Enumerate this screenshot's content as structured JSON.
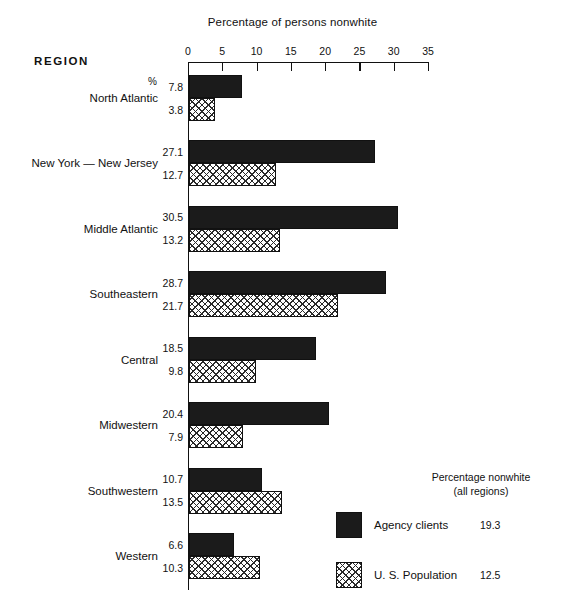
{
  "chart_data": {
    "type": "bar",
    "orientation": "horizontal",
    "title": "Percentage of persons nonwhite",
    "xlabel": "",
    "ylabel": "REGION",
    "xlim": [
      0,
      35
    ],
    "xticks": [
      0,
      5,
      10,
      15,
      20,
      25,
      30,
      35
    ],
    "grid": false,
    "legend_position": "bottom-right",
    "unit_symbol": "%",
    "categories": [
      "North Atlantic",
      "New York — New Jersey",
      "Middle Atlantic",
      "Southeastern",
      "Central",
      "Midwestern",
      "Southwestern",
      "Western"
    ],
    "series": [
      {
        "name": "Agency clients",
        "style": "solid",
        "color": "#1b1b1b",
        "values": [
          7.8,
          27.1,
          30.5,
          28.7,
          18.5,
          20.4,
          10.7,
          6.6
        ],
        "labels": [
          "7.8",
          "27.1",
          "30.5",
          "28.7",
          "18.5",
          "20.4",
          "10.7",
          "6.6"
        ]
      },
      {
        "name": "U. S. Population",
        "style": "crosshatch",
        "color": "#ffffff",
        "values": [
          3.8,
          12.7,
          13.2,
          21.7,
          9.8,
          7.9,
          13.5,
          10.3
        ],
        "labels": [
          "3.8",
          "12.7",
          "13.2",
          "21.7",
          "9.8",
          "7.9",
          "13.5",
          "10.3"
        ]
      }
    ],
    "annotations": {
      "legend_title_line1": "Percentage nonwhite",
      "legend_title_line2": "(all regions)",
      "all_regions": [
        {
          "name": "Agency clients",
          "value": "19.3"
        },
        {
          "name": "U. S. Population",
          "value": "12.5"
        }
      ]
    }
  },
  "header": {
    "region_label": "REGION",
    "percent_symbol": "%"
  }
}
